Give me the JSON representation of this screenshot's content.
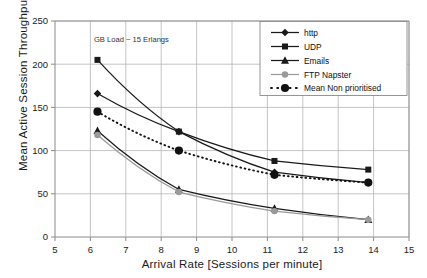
{
  "chart_data": {
    "type": "line",
    "title": "",
    "xlabel": "Arrival Rate [Sessions per minute]",
    "ylabel": "Mean Active Session Throughput [kbps]",
    "xlim": [
      5,
      15
    ],
    "ylim": [
      0,
      250
    ],
    "xticks": [
      5,
      6,
      7,
      8,
      9,
      10,
      11,
      12,
      13,
      14,
      15
    ],
    "yticks": [
      0,
      50,
      100,
      150,
      200,
      250
    ],
    "grid": true,
    "legend_position": "top-right",
    "annotations": [
      {
        "text": "GB Load ~ 15 Erlangs",
        "x": 6.1,
        "y": 226
      }
    ],
    "x": [
      6.2,
      8.5,
      11.2,
      13.85
    ],
    "series": [
      {
        "name": "http",
        "marker": "diamond",
        "color": "#1a1a1a",
        "dash": "solid",
        "values": [
          166,
          122,
          75,
          63
        ]
      },
      {
        "name": "UDP",
        "marker": "square",
        "color": "#1a1a1a",
        "dash": "solid",
        "values": [
          205,
          122,
          88,
          78
        ]
      },
      {
        "name": "Emails",
        "marker": "triangle",
        "color": "#1a1a1a",
        "dash": "solid",
        "values": [
          123,
          55,
          33,
          20
        ]
      },
      {
        "name": "FTP Napster",
        "marker": "circle",
        "color": "#9a9a9a",
        "dash": "solid",
        "values": [
          118,
          52,
          30,
          20
        ]
      },
      {
        "name": "Mean Non prioritised",
        "marker": "circle-large",
        "color": "#111111",
        "dash": "dotted",
        "values": [
          145,
          100,
          72,
          63
        ]
      }
    ]
  },
  "legend": {
    "items": [
      {
        "label": "http"
      },
      {
        "label": "UDP"
      },
      {
        "label": "Emails"
      },
      {
        "label": "FTP Napster"
      },
      {
        "label": "Mean Non prioritised"
      }
    ]
  },
  "axis_tick_labels": {
    "y": [
      "0",
      "50",
      "100",
      "150",
      "200",
      "250"
    ],
    "x": [
      "5",
      "6",
      "7",
      "8",
      "9",
      "10",
      "11",
      "12",
      "13",
      "14",
      "15"
    ]
  },
  "colors": {
    "frame": "#8a8a8a",
    "grid": "#b5b5b5",
    "dark": "#1a1a1a",
    "gray_series": "#9a9a9a",
    "background": "#ffffff"
  }
}
